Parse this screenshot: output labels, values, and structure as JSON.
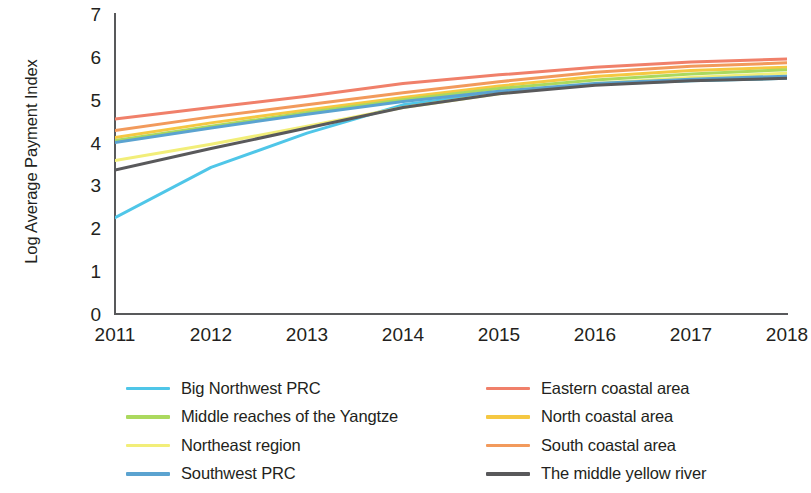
{
  "chart_data": {
    "type": "line",
    "title": "",
    "xlabel": "",
    "ylabel": "Log Average Payment Index",
    "x": [
      2011,
      2012,
      2013,
      2014,
      2015,
      2016,
      2017,
      2018
    ],
    "xtick_labels": [
      "2011",
      "2012",
      "2013",
      "2014",
      "2015",
      "2016",
      "2017",
      "2018"
    ],
    "ytick_labels": [
      "0",
      "1",
      "2",
      "3",
      "4",
      "5",
      "6",
      "7"
    ],
    "yticks": [
      0,
      1,
      2,
      3,
      4,
      5,
      6,
      7
    ],
    "ylim": [
      0,
      7
    ],
    "xlim": [
      2011,
      2018
    ],
    "grid": false,
    "legend_position": "below-plot-two-columns",
    "series": [
      {
        "name": "Big Northwest PRC",
        "color": "#4FC6E8",
        "values": [
          2.25,
          3.42,
          4.22,
          4.88,
          5.16,
          5.36,
          5.44,
          5.5
        ]
      },
      {
        "name": "Middle reaches of the Yangtze",
        "color": "#ABD95E",
        "values": [
          4.05,
          4.38,
          4.7,
          5.0,
          5.26,
          5.46,
          5.6,
          5.7
        ]
      },
      {
        "name": "Northeast region",
        "color": "#F2EE79",
        "values": [
          3.58,
          3.96,
          4.38,
          4.82,
          5.14,
          5.38,
          5.52,
          5.62
        ]
      },
      {
        "name": "Southwest PRC",
        "color": "#5BA3D0",
        "values": [
          4.0,
          4.34,
          4.66,
          4.96,
          5.2,
          5.38,
          5.48,
          5.55
        ]
      },
      {
        "name": "Eastern coastal area",
        "color": "#F0806A",
        "values": [
          4.55,
          4.82,
          5.08,
          5.38,
          5.58,
          5.76,
          5.88,
          5.95
        ]
      },
      {
        "name": "North coastal area",
        "color": "#F5C842",
        "values": [
          4.12,
          4.46,
          4.76,
          5.05,
          5.32,
          5.54,
          5.68,
          5.76
        ]
      },
      {
        "name": "South coastal area",
        "color": "#F29A5C",
        "values": [
          4.28,
          4.6,
          4.88,
          5.16,
          5.42,
          5.64,
          5.78,
          5.86
        ]
      },
      {
        "name": "The middle yellow river",
        "color": "#59595B",
        "values": [
          3.36,
          3.86,
          4.34,
          4.82,
          5.14,
          5.34,
          5.44,
          5.5
        ]
      }
    ]
  },
  "legend": {
    "columns": [
      {
        "items": [
          {
            "label": "Big Northwest PRC",
            "color": "#4FC6E8"
          },
          {
            "label": "Middle reaches of the Yangtze",
            "color": "#ABD95E"
          },
          {
            "label": "Northeast region",
            "color": "#F2EE79"
          },
          {
            "label": "Southwest PRC",
            "color": "#5BA3D0"
          }
        ]
      },
      {
        "items": [
          {
            "label": "Eastern coastal area",
            "color": "#F0806A"
          },
          {
            "label": "North coastal area",
            "color": "#F5C842"
          },
          {
            "label": "South coastal area",
            "color": "#F29A5C"
          },
          {
            "label": "The middle yellow river",
            "color": "#59595B"
          }
        ]
      }
    ]
  },
  "axes": {
    "axis_color": "#58595B"
  }
}
